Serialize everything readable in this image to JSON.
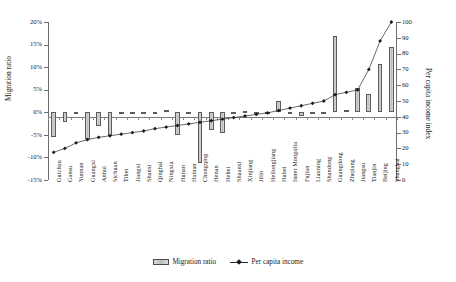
{
  "chart_data": {
    "type": "bar",
    "title": "",
    "xlabel": "",
    "ylabel": "Migration ratio",
    "y2label": "Per capita income index",
    "ylim": [
      -15,
      20
    ],
    "y2lim": [
      0,
      100
    ],
    "yticks": [
      "-15%",
      "-10%",
      "-5%",
      "0%",
      "5%",
      "10%",
      "15%",
      "20%"
    ],
    "ytick_values": [
      -15,
      -10,
      -5,
      0,
      5,
      10,
      15,
      20
    ],
    "y2ticks": [
      "0",
      "10",
      "20",
      "30",
      "40",
      "50",
      "60",
      "70",
      "80",
      "90",
      "100"
    ],
    "y2tick_values": [
      0,
      10,
      20,
      30,
      40,
      50,
      60,
      70,
      80,
      90,
      100
    ],
    "grid": false,
    "legend_position": "bottom",
    "categories": [
      "Guizhou",
      "Gansu",
      "Yunnan",
      "Guangxi",
      "Anhui",
      "Sichuan",
      "Tibet",
      "Jiangxi",
      "Shanxi",
      "Qinghai",
      "Ningxia",
      "Hunan",
      "Hainan",
      "Chongqing",
      "Henan",
      "Hebei",
      "Shaanxi",
      "Xinjiang",
      "Jilin",
      "Heilongjiang",
      "Hubei",
      "Inner Mongolia",
      "Fujian",
      "Liaoning",
      "Shandong",
      "Guangdong",
      "Zhejiang",
      "Jiangsu",
      "Tianjin",
      "Beijing",
      "Shanghai"
    ],
    "series": [
      {
        "name": "Migration ratio",
        "type": "bar",
        "unit": "%",
        "values": [
          -5.4,
          -2.1,
          -0.3,
          -6.0,
          -3.1,
          -5.3,
          -0.2,
          -0.3,
          -0.3,
          -0.2,
          0.6,
          -5.1,
          -0.3,
          -11.3,
          -4.0,
          -4.5,
          -0.4,
          0.3,
          -0.3,
          -0.3,
          2.6,
          -0.4,
          -0.9,
          -0.4,
          -0.3,
          17.0,
          0.6,
          5.3,
          4.0,
          10.8,
          14.5
        ]
      },
      {
        "name": "Per capita income",
        "type": "line",
        "unit": "index",
        "values": [
          17.5,
          20.0,
          23.5,
          25.5,
          27.0,
          28.0,
          29.0,
          30.0,
          31.0,
          32.5,
          33.5,
          34.5,
          35.5,
          36.5,
          37.5,
          38.5,
          39.5,
          40.5,
          41.5,
          42.5,
          44.0,
          45.5,
          47.0,
          48.5,
          50.0,
          54.0,
          55.5,
          57.0,
          70.0,
          88.0,
          100.0
        ]
      }
    ]
  },
  "legend": {
    "items": [
      {
        "label": "Migration ratio",
        "marker": "bar-swatch"
      },
      {
        "label": "Per capita income",
        "marker": "line-diamond"
      }
    ]
  }
}
